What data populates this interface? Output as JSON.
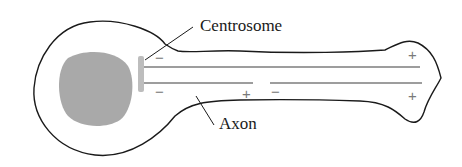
{
  "figure": {
    "labels": {
      "centrosome": "Centrosome",
      "axon": "Axon"
    },
    "signs": {
      "minus_top_left": "−",
      "minus_bottom_left": "−",
      "plus_bottom_mid": "+",
      "minus_bottom_mid": "−",
      "plus_top_right": "+",
      "plus_bottom_right": "+"
    },
    "colors": {
      "outline": "#1a1a1a",
      "nucleus": "#a9a9a9",
      "centrosome": "#bdbdbd",
      "microtubule": "#7d7d7d"
    }
  }
}
